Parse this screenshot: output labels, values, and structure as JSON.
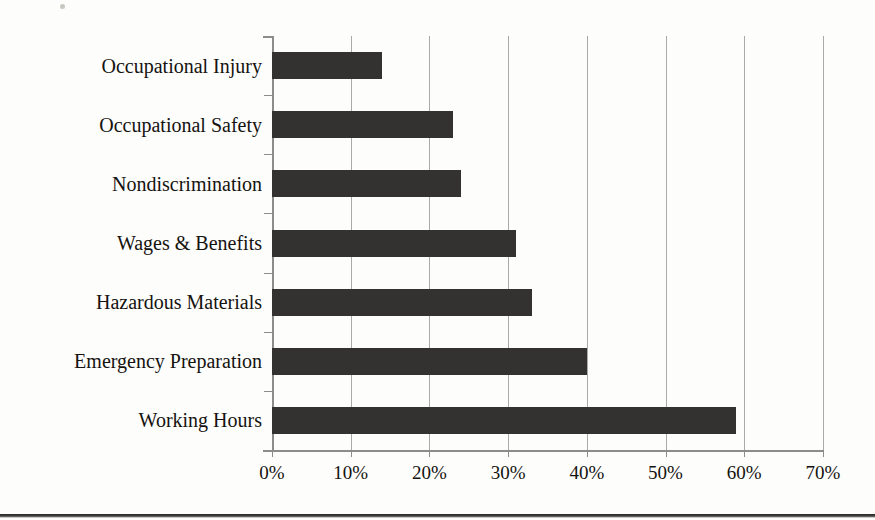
{
  "chart_data": {
    "type": "bar",
    "orientation": "horizontal",
    "title": "",
    "subtitle": "",
    "xlabel": "",
    "ylabel": "",
    "categories": [
      "Occupational Injury",
      "Occupational Safety",
      "Nondiscrimination",
      "Wages & Benefits",
      "Hazardous Materials",
      "Emergency Preparation",
      "Working Hours"
    ],
    "values": [
      14,
      23,
      24,
      31,
      33,
      40,
      59
    ],
    "value_suffix": "%",
    "xlim": [
      0,
      70
    ],
    "xticks": [
      0,
      10,
      20,
      30,
      40,
      50,
      60,
      70
    ],
    "xtick_labels": [
      "0%",
      "10%",
      "20%",
      "30%",
      "40%",
      "50%",
      "60%",
      "70%"
    ],
    "grid": true,
    "grid_axis": "x",
    "legend": false,
    "legend_position": "none",
    "bar_color": "#333231",
    "gridline_color": "#a9a9a9",
    "axis_color": "#8c8c8c",
    "text_color": "#15130f"
  }
}
